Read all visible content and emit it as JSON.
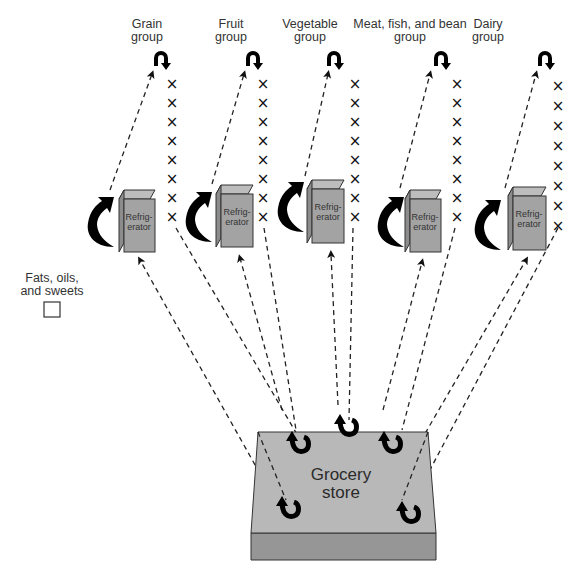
{
  "figure": {
    "type": "diagram",
    "groups": [
      {
        "id": "grain",
        "label_line1": "Grain",
        "label_line2": "group",
        "x_marks": 8,
        "fridge_label_line1": "Refrig-",
        "fridge_label_line2": "erator"
      },
      {
        "id": "fruit",
        "label_line1": "Fruit",
        "label_line2": "group",
        "x_marks": 8,
        "fridge_label_line1": "Refrig-",
        "fridge_label_line2": "erator"
      },
      {
        "id": "vegetable",
        "label_line1": "Vegetable",
        "label_line2": "group",
        "x_marks": 8,
        "fridge_label_line1": "Refrig-",
        "fridge_label_line2": "erator"
      },
      {
        "id": "meat",
        "label_line1": "Meat, fish, and bean",
        "label_line2": "group",
        "x_marks": 8,
        "fridge_label_line1": "Refrig-",
        "fridge_label_line2": "erator"
      },
      {
        "id": "dairy",
        "label_line1": "Dairy",
        "label_line2": "group",
        "x_marks": 8,
        "fridge_label_line1": "Refrig-",
        "fridge_label_line2": "erator"
      }
    ],
    "fats": {
      "label_line1": "Fats, oils,",
      "label_line2": "and sweets",
      "box": "empty"
    },
    "store": {
      "label_line1": "Grocery",
      "label_line2": "store"
    },
    "x_glyph": "×",
    "colors": {
      "box_fill": "#a3a3a3",
      "box_side": "#8c8c8c",
      "store_top": "#b5b5b5",
      "store_front": "#969696",
      "stroke": "#333333",
      "arrow": "#000000"
    }
  }
}
